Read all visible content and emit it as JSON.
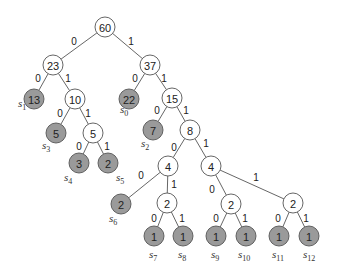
{
  "diagram": {
    "type": "huffman-tree",
    "node_radius": 10,
    "colors": {
      "internal_fill": "#ffffff",
      "leaf_fill": "#9a9a9a",
      "stroke": "#555555"
    },
    "nodes": [
      {
        "id": "n60",
        "value": "60",
        "kind": "internal",
        "x": 105,
        "y": 27
      },
      {
        "id": "n23",
        "value": "23",
        "kind": "internal",
        "x": 53,
        "y": 65
      },
      {
        "id": "n37",
        "value": "37",
        "kind": "internal",
        "x": 150,
        "y": 65
      },
      {
        "id": "n13",
        "value": "13",
        "kind": "leaf",
        "x": 34,
        "y": 99,
        "symbol": "s",
        "sub": "1",
        "lx": 18,
        "ly": 107
      },
      {
        "id": "n10",
        "value": "10",
        "kind": "internal",
        "x": 75,
        "y": 99
      },
      {
        "id": "n22",
        "value": "22",
        "kind": "leaf",
        "x": 129,
        "y": 99,
        "symbol": "s",
        "sub": "0",
        "lx": 120,
        "ly": 113
      },
      {
        "id": "n15",
        "value": "15",
        "kind": "internal",
        "x": 172,
        "y": 98
      },
      {
        "id": "n5a",
        "value": "5",
        "kind": "leaf",
        "x": 56,
        "y": 133,
        "symbol": "s",
        "sub": "3",
        "lx": 42,
        "ly": 149
      },
      {
        "id": "n5b",
        "value": "5",
        "kind": "internal",
        "x": 93,
        "y": 133
      },
      {
        "id": "n7",
        "value": "7",
        "kind": "leaf",
        "x": 153,
        "y": 130,
        "symbol": "s",
        "sub": "2",
        "lx": 141,
        "ly": 147
      },
      {
        "id": "n8",
        "value": "8",
        "kind": "internal",
        "x": 190,
        "y": 130
      },
      {
        "id": "n3",
        "value": "3",
        "kind": "leaf",
        "x": 79,
        "y": 163,
        "symbol": "s",
        "sub": "4",
        "lx": 64,
        "ly": 181
      },
      {
        "id": "n2a",
        "value": "2",
        "kind": "leaf",
        "x": 108,
        "y": 163,
        "symbol": "s",
        "sub": "5",
        "lx": 116,
        "ly": 181
      },
      {
        "id": "n4a",
        "value": "4",
        "kind": "internal",
        "x": 168,
        "y": 166
      },
      {
        "id": "n4b",
        "value": "4",
        "kind": "internal",
        "x": 211,
        "y": 166
      },
      {
        "id": "n2b",
        "value": "2",
        "kind": "leaf",
        "x": 121,
        "y": 204,
        "symbol": "s",
        "sub": "6",
        "lx": 109,
        "ly": 222
      },
      {
        "id": "n2c",
        "value": "2",
        "kind": "internal",
        "x": 167,
        "y": 203
      },
      {
        "id": "n2d",
        "value": "2",
        "kind": "internal",
        "x": 231,
        "y": 204
      },
      {
        "id": "n2e",
        "value": "2",
        "kind": "internal",
        "x": 293,
        "y": 203
      },
      {
        "id": "n1a",
        "value": "1",
        "kind": "leaf",
        "x": 154,
        "y": 236,
        "symbol": "s",
        "sub": "7",
        "lx": 149,
        "ly": 258
      },
      {
        "id": "n1b",
        "value": "1",
        "kind": "leaf",
        "x": 183,
        "y": 236,
        "symbol": "s",
        "sub": "8",
        "lx": 178,
        "ly": 258
      },
      {
        "id": "n1c",
        "value": "1",
        "kind": "leaf",
        "x": 216,
        "y": 236,
        "symbol": "s",
        "sub": "9",
        "lx": 211,
        "ly": 258
      },
      {
        "id": "n1d",
        "value": "1",
        "kind": "leaf",
        "x": 246,
        "y": 236,
        "symbol": "s",
        "sub": "10",
        "lx": 238,
        "ly": 258
      },
      {
        "id": "n1e",
        "value": "1",
        "kind": "leaf",
        "x": 279,
        "y": 236,
        "symbol": "s",
        "sub": "11",
        "lx": 272,
        "ly": 258
      },
      {
        "id": "n1f",
        "value": "1",
        "kind": "leaf",
        "x": 309,
        "y": 236,
        "symbol": "s",
        "sub": "12",
        "lx": 303,
        "ly": 258
      }
    ],
    "edges": [
      {
        "from": "n60",
        "to": "n23",
        "bit": "0",
        "bx": 74,
        "by": 41
      },
      {
        "from": "n60",
        "to": "n37",
        "bit": "1",
        "bx": 131,
        "by": 41
      },
      {
        "from": "n23",
        "to": "n13",
        "bit": "0",
        "bx": 38,
        "by": 78
      },
      {
        "from": "n23",
        "to": "n10",
        "bit": "1",
        "bx": 68,
        "by": 78
      },
      {
        "from": "n37",
        "to": "n22",
        "bit": "0",
        "bx": 135,
        "by": 78
      },
      {
        "from": "n37",
        "to": "n15",
        "bit": "1",
        "bx": 164,
        "by": 78
      },
      {
        "from": "n10",
        "to": "n5a",
        "bit": "0",
        "bx": 60,
        "by": 113
      },
      {
        "from": "n10",
        "to": "n5b",
        "bit": "1",
        "bx": 88,
        "by": 113
      },
      {
        "from": "n15",
        "to": "n7",
        "bit": "0",
        "bx": 157,
        "by": 110
      },
      {
        "from": "n15",
        "to": "n8",
        "bit": "1",
        "bx": 186,
        "by": 110
      },
      {
        "from": "n5b",
        "to": "n3",
        "bit": "0",
        "bx": 79,
        "by": 146
      },
      {
        "from": "n5b",
        "to": "n2a",
        "bit": "1",
        "bx": 107,
        "by": 146
      },
      {
        "from": "n8",
        "to": "n4a",
        "bit": "0",
        "bx": 174,
        "by": 147
      },
      {
        "from": "n8",
        "to": "n4b",
        "bit": "1",
        "bx": 206,
        "by": 143
      },
      {
        "from": "n4a",
        "to": "n2b",
        "bit": "0",
        "bx": 141,
        "by": 175
      },
      {
        "from": "n4a",
        "to": "n2c",
        "bit": "1",
        "bx": 174,
        "by": 184
      },
      {
        "from": "n4b",
        "to": "n2d",
        "bit": "0",
        "bx": 212,
        "by": 189
      },
      {
        "from": "n4b",
        "to": "n2e",
        "bit": "1",
        "bx": 256,
        "by": 177
      },
      {
        "from": "n2c",
        "to": "n1a",
        "bit": "0",
        "bx": 154,
        "by": 218
      },
      {
        "from": "n2c",
        "to": "n1b",
        "bit": "1",
        "bx": 182,
        "by": 218
      },
      {
        "from": "n2d",
        "to": "n1c",
        "bit": "0",
        "bx": 216,
        "by": 218
      },
      {
        "from": "n2d",
        "to": "n1d",
        "bit": "1",
        "bx": 245,
        "by": 218
      },
      {
        "from": "n2e",
        "to": "n1e",
        "bit": "0",
        "bx": 278,
        "by": 218
      },
      {
        "from": "n2e",
        "to": "n1f",
        "bit": "1",
        "bx": 306,
        "by": 218
      }
    ]
  }
}
